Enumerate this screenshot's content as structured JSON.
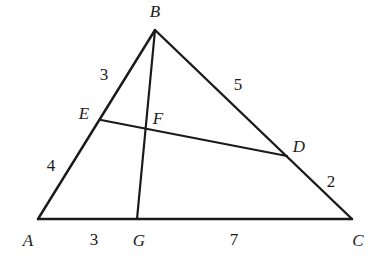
{
  "figure": {
    "type": "euclidean-geometry-diagram",
    "background_color": "#ffffff",
    "stroke_color": "#1a1a1a",
    "text_color": "#1a1a1a",
    "width": 385,
    "height": 267
  },
  "points": {
    "A": {
      "label": "A",
      "x": 38,
      "y": 219,
      "label_x": 28,
      "label_y": 240
    },
    "B": {
      "label": "B",
      "x": 155,
      "y": 30,
      "label_x": 155,
      "label_y": 11
    },
    "C": {
      "label": "C",
      "x": 352,
      "y": 219,
      "label_x": 358,
      "label_y": 240
    },
    "D": {
      "label": "D",
      "x": 287,
      "y": 156,
      "label_x": 299,
      "label_y": 146
    },
    "E": {
      "label": "E",
      "x": 101,
      "y": 120,
      "label_x": 84,
      "label_y": 113
    },
    "F": {
      "label": "F",
      "x": 146,
      "y": 128,
      "label_x": 158,
      "label_y": 118
    },
    "G": {
      "label": "G",
      "x": 137,
      "y": 219,
      "label_x": 139,
      "label_y": 240
    }
  },
  "segments": [
    {
      "name": "side-AB",
      "from": "A",
      "to": "B"
    },
    {
      "name": "side-BC",
      "from": "B",
      "to": "C"
    },
    {
      "name": "side-AC",
      "from": "A",
      "to": "C"
    },
    {
      "name": "cevian-BG",
      "from": "B",
      "to": "G"
    },
    {
      "name": "cevian-ED",
      "from": "E",
      "to": "D"
    }
  ],
  "lengths": [
    {
      "name": "length-BE",
      "value": "3",
      "segment": "B-E",
      "x": 104,
      "y": 74
    },
    {
      "name": "length-EA",
      "value": "4",
      "segment": "E-A",
      "x": 51,
      "y": 165
    },
    {
      "name": "length-BD",
      "value": "5",
      "segment": "B-D",
      "x": 238,
      "y": 84
    },
    {
      "name": "length-DC",
      "value": "2",
      "segment": "D-C",
      "x": 331,
      "y": 181
    },
    {
      "name": "length-AG",
      "value": "3",
      "segment": "A-G",
      "x": 94,
      "y": 239
    },
    {
      "name": "length-GC",
      "value": "7",
      "segment": "G-C",
      "x": 234,
      "y": 239
    }
  ]
}
